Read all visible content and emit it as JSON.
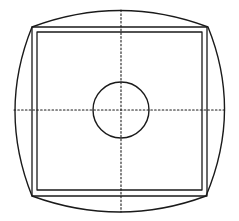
{
  "diagram": {
    "title": "",
    "colors": {
      "stroke": "#1a1a1a",
      "background": "#ffffff"
    },
    "elements": {
      "outer_curved_outline": {
        "corners": [
          [
            32,
            27
          ],
          [
            208,
            27
          ],
          [
            206,
            196
          ],
          [
            32,
            196
          ]
        ],
        "bulge": {
          "top": 10,
          "bottom": 212,
          "left": 14,
          "right": 225
        }
      },
      "outer_square": {
        "x": 32,
        "y": 27,
        "width": 175,
        "height": 169
      },
      "inner_square": {
        "x": 37,
        "y": 32,
        "width": 165,
        "height": 158
      },
      "crosshair": {
        "cx": 121,
        "cy": 110,
        "style": "dotted"
      },
      "center_circle": {
        "cx": 121,
        "cy": 110,
        "r": 28
      }
    }
  }
}
